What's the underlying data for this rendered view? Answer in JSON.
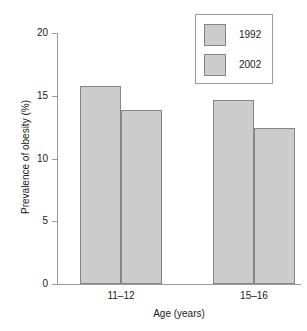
{
  "chart_data": {
    "type": "bar",
    "title": "",
    "subtitle": "",
    "xlabel": "Age (years)",
    "ylabel": "Prevalence of obesity (%)",
    "categories": [
      "11–12",
      "15–16"
    ],
    "series": [
      {
        "name": "1992",
        "values": [
          15.8,
          14.7
        ],
        "color": "#cccccc"
      },
      {
        "name": "2002",
        "values": [
          13.9,
          12.4
        ],
        "color": "#cccccc"
      }
    ],
    "ylim": [
      0,
      20
    ],
    "yticks": [
      0,
      5,
      10,
      15,
      20
    ],
    "ytick_labels": [
      "0",
      "5",
      "10",
      "15",
      "20"
    ],
    "grid": false,
    "legend_position": "top-right",
    "bar_fill_color": "#cccccc",
    "bar_border_color": "#858585",
    "axis_color": "#9a9a9a",
    "background_color": "#ffffff"
  },
  "legend": {
    "entries": [
      {
        "label": "1992"
      },
      {
        "label": "2002"
      }
    ]
  },
  "axes": {
    "y_title": "Prevalence of obesity (%)",
    "x_title": "Age (years)",
    "y_tick_labels": [
      "20",
      "15",
      "10",
      "5",
      "0"
    ],
    "x_tick_labels": [
      "11–12",
      "15–16"
    ]
  }
}
